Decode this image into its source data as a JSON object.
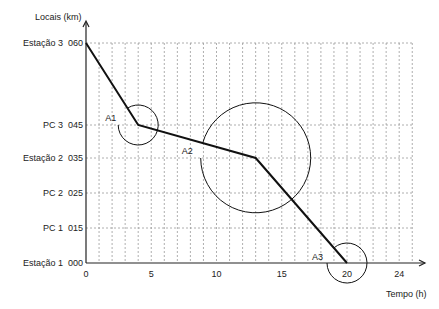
{
  "chart_data": {
    "type": "line",
    "title": "",
    "ylabel": "Locais (km)",
    "xlabel": "Tempo (h)",
    "x_ticks": [
      "0",
      "5",
      "10",
      "15",
      "20",
      "24"
    ],
    "x_tick_values": [
      0,
      5,
      10,
      15,
      20,
      24
    ],
    "xlim": [
      0,
      25
    ],
    "grid": true,
    "y_levels": [
      {
        "name": "Estação 1",
        "code": "000",
        "km": 0
      },
      {
        "name": "PC 1",
        "code": "015",
        "km": 15
      },
      {
        "name": "PC 2",
        "code": "025",
        "km": 25
      },
      {
        "name": "Estação 2",
        "code": "035",
        "km": 35
      },
      {
        "name": "PC 3",
        "code": "045",
        "km": 45
      },
      {
        "name": "Estação 3",
        "code": "060",
        "km": 60
      }
    ],
    "series": [
      {
        "name": "trajeto",
        "points": [
          [
            0,
            60
          ],
          [
            4,
            45
          ],
          [
            13,
            35
          ],
          [
            20,
            0
          ]
        ]
      }
    ],
    "angles": [
      {
        "label": "A1",
        "at": [
          4,
          45
        ]
      },
      {
        "label": "A2",
        "at": [
          13,
          35
        ]
      },
      {
        "label": "A3",
        "at": [
          20,
          0
        ]
      }
    ]
  }
}
